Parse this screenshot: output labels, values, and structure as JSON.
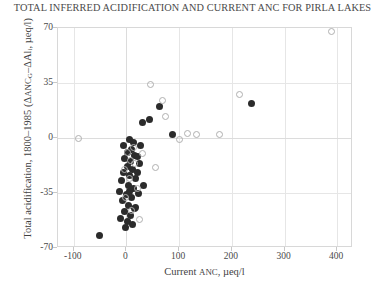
{
  "chart_data": {
    "type": "scatter",
    "title": "TOTAL INFERRED ACIDIFICATION AND CURRENT ANC FOR PIRLA LAKES",
    "xlabel": "Current ANC, µeq/l",
    "ylabel": "Total acidification, 1800–1985 (ΔANC_G–ΔAl_i, µeq/l)",
    "ylabel_parts": {
      "prefix": "Total acidification, 1800–1985  (Δ",
      "sc1": "anc",
      "sub1": "G",
      "mid": "–ΔAl",
      "sub2": "i",
      "suffix": ", µeq/l)"
    },
    "xlabel_parts": {
      "prefix": "Current ",
      "sc": "anc",
      "suffix": ", µeq/l"
    },
    "xlim": [
      -130,
      430
    ],
    "ylim": [
      -70,
      70
    ],
    "xticks": [
      -100,
      0,
      100,
      200,
      300,
      400
    ],
    "xtick_labels": [
      "-100",
      "0",
      "100",
      "200",
      "300",
      "400"
    ],
    "yticks": [
      70,
      35,
      0,
      -35,
      -70
    ],
    "ytick_labels": [
      "70",
      "35",
      "0",
      "-35",
      "-70"
    ],
    "grid": true,
    "legend": null,
    "series": [
      {
        "name": "filled",
        "marker": "filled-circle",
        "color": "#2b2b2b",
        "points": [
          [
            6,
            -1
          ],
          [
            14,
            -3
          ],
          [
            10,
            -7
          ],
          [
            2,
            -9
          ],
          [
            16,
            -11
          ],
          [
            -3,
            -13
          ],
          [
            8,
            -15
          ],
          [
            20,
            -12
          ],
          [
            1,
            -18
          ],
          [
            12,
            -20
          ],
          [
            24,
            -16
          ],
          [
            -6,
            -22
          ],
          [
            6,
            -24
          ],
          [
            18,
            -26
          ],
          [
            -10,
            -27
          ],
          [
            3,
            -30
          ],
          [
            14,
            -32
          ],
          [
            -14,
            -34
          ],
          [
            0,
            -36
          ],
          [
            10,
            -38
          ],
          [
            22,
            -35
          ],
          [
            -8,
            -40
          ],
          [
            4,
            -43
          ],
          [
            16,
            -45
          ],
          [
            -4,
            -47
          ],
          [
            8,
            -49
          ],
          [
            -12,
            -51
          ],
          [
            2,
            -53
          ],
          [
            12,
            -55
          ],
          [
            -2,
            -57
          ],
          [
            -52,
            -62
          ],
          [
            26,
            -5
          ],
          [
            30,
            10
          ],
          [
            33,
            -30
          ],
          [
            44,
            12
          ],
          [
            62,
            20
          ],
          [
            88,
            2
          ],
          [
            238,
            22
          ],
          [
            18,
            -44
          ],
          [
            6,
            -34
          ],
          [
            20,
            -22
          ],
          [
            -6,
            -5
          ]
        ]
      },
      {
        "name": "open",
        "marker": "open-circle",
        "color": "#b0b0b0",
        "points": [
          [
            -92,
            0
          ],
          [
            2,
            -9
          ],
          [
            8,
            -14
          ],
          [
            -4,
            -20
          ],
          [
            14,
            -6
          ],
          [
            6,
            -26
          ],
          [
            20,
            -32
          ],
          [
            -2,
            -38
          ],
          [
            10,
            -46
          ],
          [
            24,
            -52
          ],
          [
            46,
            34
          ],
          [
            56,
            -19
          ],
          [
            68,
            24
          ],
          [
            74,
            14
          ],
          [
            100,
            -1
          ],
          [
            116,
            3
          ],
          [
            132,
            2
          ],
          [
            176,
            2
          ],
          [
            214,
            28
          ],
          [
            390,
            68
          ],
          [
            16,
            -16
          ],
          [
            30,
            -10
          ]
        ]
      }
    ]
  }
}
